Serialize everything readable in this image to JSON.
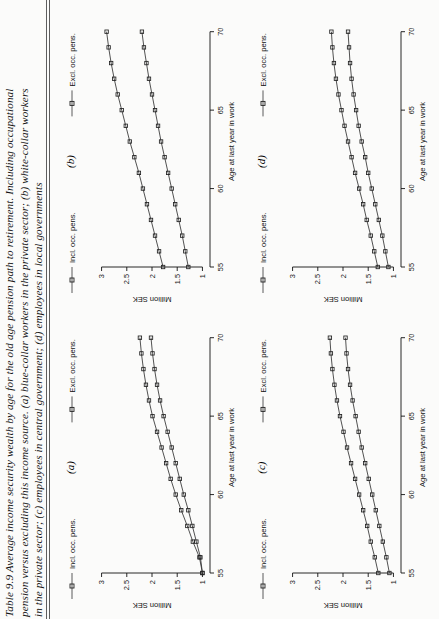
{
  "caption": {
    "lines": [
      "Table 9.9 Average income security wealth by age for the old age pension path to retirement. Including occupational",
      "pension versus excluding this income source. (a) blue-collar workers in the private sector; (b) white-collar workers",
      "in the private sector; (c) employees in central government; (d) employees in local governments"
    ],
    "label": "Table 9.9"
  },
  "chart_data": [
    {
      "type": "line",
      "panel": "(a)",
      "title": "(a)",
      "xlabel": "Age at last year in work",
      "ylabel": "Million SEK",
      "xticks": [
        55,
        60,
        65,
        70
      ],
      "yticks": [
        1,
        1.5,
        2,
        2.5,
        3
      ],
      "xlim": [
        55,
        71
      ],
      "ylim": [
        0.85,
        3.15
      ],
      "grid": false,
      "legend_position": "top",
      "x": [
        55,
        56,
        57,
        58,
        59,
        60,
        61,
        62,
        63,
        64,
        65,
        66,
        67,
        68,
        69,
        70
      ],
      "series": [
        {
          "name": "Incl. occ. pens.",
          "values": [
            1.0,
            1.06,
            1.19,
            1.3,
            1.42,
            1.53,
            1.63,
            1.72,
            1.81,
            1.9,
            1.99,
            2.06,
            2.12,
            2.17,
            2.21,
            2.24
          ]
        },
        {
          "name": "Excl. occ. pens.",
          "values": [
            1.0,
            1.04,
            1.12,
            1.2,
            1.28,
            1.37,
            1.45,
            1.53,
            1.61,
            1.69,
            1.77,
            1.84,
            1.9,
            1.95,
            1.99,
            2.02
          ]
        }
      ]
    },
    {
      "type": "line",
      "panel": "(b)",
      "title": "(b)",
      "xlabel": "Age at last year in work",
      "ylabel": "Million SEK",
      "xticks": [
        55,
        60,
        65,
        70
      ],
      "yticks": [
        1,
        1.5,
        2,
        2.5,
        3
      ],
      "xlim": [
        55,
        71
      ],
      "ylim": [
        0.85,
        3.15
      ],
      "grid": false,
      "legend_position": "top",
      "x": [
        55,
        56,
        57,
        58,
        59,
        60,
        61,
        62,
        63,
        64,
        65,
        66,
        67,
        68,
        69,
        70
      ],
      "series": [
        {
          "name": "Incl. occ. pens.",
          "values": [
            1.78,
            1.86,
            1.94,
            2.02,
            2.1,
            2.18,
            2.26,
            2.35,
            2.44,
            2.52,
            2.6,
            2.68,
            2.75,
            2.81,
            2.86,
            2.9
          ]
        },
        {
          "name": "Excl. occ. pens.",
          "values": [
            1.28,
            1.34,
            1.4,
            1.47,
            1.54,
            1.61,
            1.68,
            1.75,
            1.82,
            1.88,
            1.94,
            2.0,
            2.06,
            2.11,
            2.16,
            2.2
          ]
        }
      ]
    },
    {
      "type": "line",
      "panel": "(c)",
      "title": "(c)",
      "xlabel": "Age at last year in work",
      "ylabel": "Million SEK",
      "xticks": [
        55,
        60,
        65,
        70
      ],
      "yticks": [
        1,
        1.5,
        2,
        2.5,
        3
      ],
      "xlim": [
        55,
        71
      ],
      "ylim": [
        0.85,
        3.15
      ],
      "grid": false,
      "legend_position": "top",
      "x": [
        55,
        56,
        57,
        58,
        59,
        60,
        61,
        62,
        63,
        64,
        65,
        66,
        67,
        68,
        69,
        70
      ],
      "series": [
        {
          "name": "Incl. occ. pens.",
          "values": [
            1.3,
            1.37,
            1.45,
            1.52,
            1.6,
            1.68,
            1.76,
            1.84,
            1.92,
            1.99,
            2.06,
            2.12,
            2.17,
            2.21,
            2.24,
            2.26
          ]
        },
        {
          "name": "Excl. occ. pens.",
          "values": [
            1.08,
            1.14,
            1.21,
            1.28,
            1.35,
            1.42,
            1.49,
            1.56,
            1.63,
            1.69,
            1.75,
            1.81,
            1.86,
            1.9,
            1.93,
            1.95
          ]
        }
      ]
    },
    {
      "type": "line",
      "panel": "(d)",
      "title": "(d)",
      "xlabel": "Age at last year in work",
      "ylabel": "Million SEK",
      "xticks": [
        55,
        60,
        65,
        70
      ],
      "yticks": [
        1,
        1.5,
        2,
        2.5,
        3
      ],
      "xlim": [
        55,
        71
      ],
      "ylim": [
        0.85,
        3.15
      ],
      "grid": false,
      "legend_position": "top",
      "x": [
        55,
        56,
        57,
        58,
        59,
        60,
        61,
        62,
        63,
        64,
        65,
        66,
        67,
        68,
        69,
        70
      ],
      "series": [
        {
          "name": "Incl. occ. pens.",
          "values": [
            1.31,
            1.38,
            1.45,
            1.53,
            1.6,
            1.68,
            1.76,
            1.83,
            1.9,
            1.97,
            2.03,
            2.09,
            2.14,
            2.18,
            2.21,
            2.23
          ]
        },
        {
          "name": "Excl. occ. pens.",
          "values": [
            1.1,
            1.16,
            1.22,
            1.29,
            1.36,
            1.43,
            1.5,
            1.56,
            1.63,
            1.69,
            1.74,
            1.79,
            1.83,
            1.86,
            1.88,
            1.9
          ]
        }
      ]
    }
  ],
  "colors": {
    "ink": "#111111",
    "line": "#444444",
    "page": "#fbfbfa"
  }
}
